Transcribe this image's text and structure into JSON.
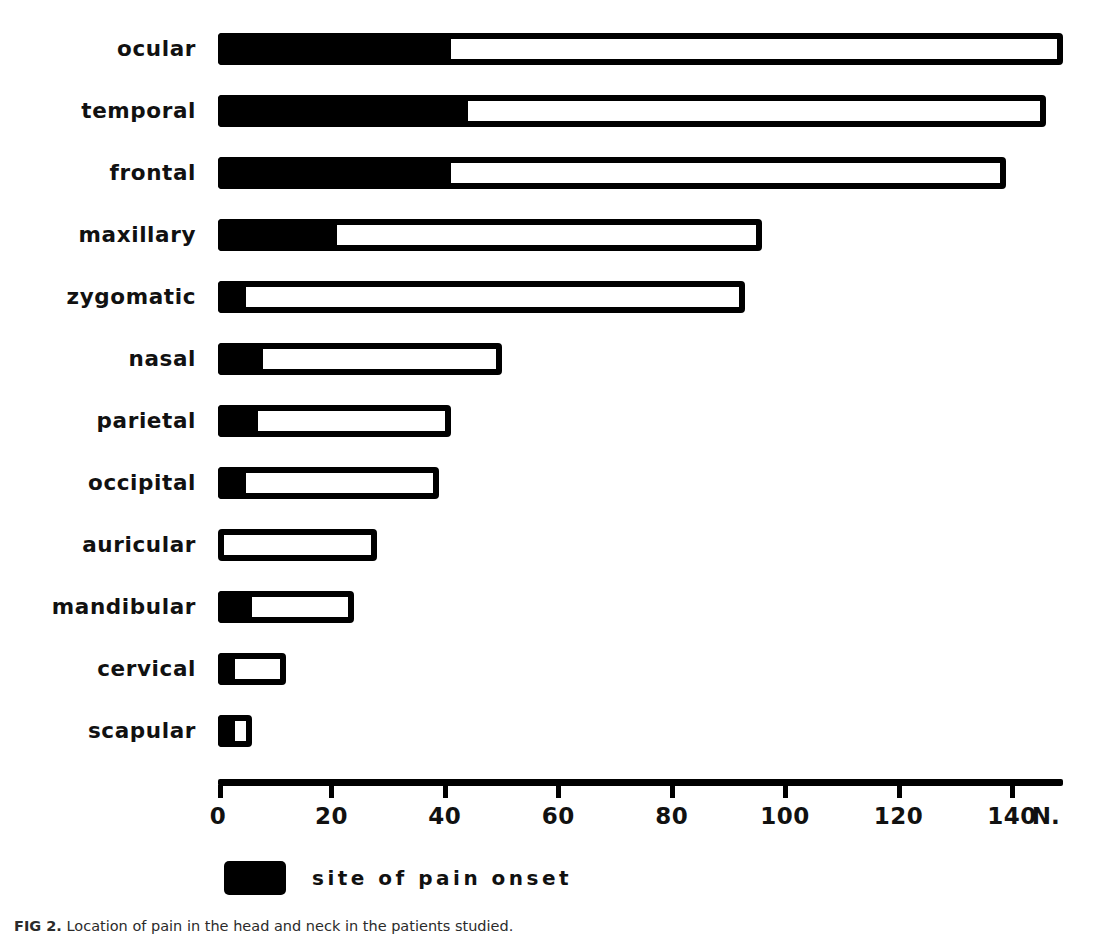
{
  "figure": {
    "caption_lead": "FIG 2.",
    "caption_text": " Location of pain in the head and neck in the patients studied.",
    "legend": {
      "swatch_name": "black-swatch",
      "label": "site of pain onset"
    }
  },
  "chart_data": {
    "type": "bar",
    "orientation": "horizontal",
    "title": "",
    "subtitle": "",
    "xlabel": "N.",
    "ylabel": "",
    "xlim": [
      0,
      150
    ],
    "grid": false,
    "legend_position": "below-axis",
    "xticks": [
      0,
      20,
      40,
      60,
      80,
      100,
      120,
      140
    ],
    "xtick_labels": [
      "0",
      "20",
      "40",
      "60",
      "80",
      "100",
      "120",
      "140"
    ],
    "axis_unit_label": "N.",
    "categories": [
      "ocular",
      "temporal",
      "frontal",
      "maxillary",
      "zygomatic",
      "nasal",
      "parietal",
      "occipital",
      "auricular",
      "mandibular",
      "cervical",
      "scapular"
    ],
    "series": [
      {
        "name": "site of pain onset",
        "values": [
          41,
          44,
          41,
          21,
          5,
          8,
          7,
          5,
          0,
          6,
          3,
          3
        ]
      },
      {
        "name": "total site of pain",
        "values": [
          149,
          146,
          139,
          96,
          93,
          50,
          41,
          39,
          28,
          24,
          12,
          6
        ]
      }
    ]
  }
}
